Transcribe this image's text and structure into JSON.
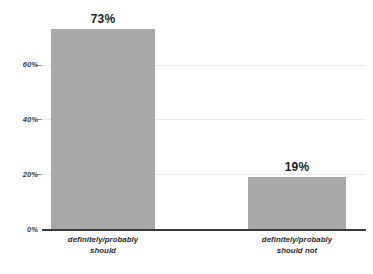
{
  "chart_data": {
    "type": "bar",
    "title": "",
    "subtitle": "",
    "xlabel": "",
    "ylabel": "",
    "categories": [
      "definitely/probably should",
      "definitely/probably should not"
    ],
    "category_lines": [
      [
        "definitely/probably",
        "should"
      ],
      [
        "definitely/probably",
        "should not"
      ]
    ],
    "values": [
      73,
      19
    ],
    "value_labels": [
      "73%",
      "19%"
    ],
    "ylim": [
      0,
      80
    ],
    "yticks": [
      0,
      20,
      40,
      60
    ],
    "ytick_labels": [
      "0%",
      "20%",
      "40%",
      "60%"
    ],
    "grid": true,
    "legend": false,
    "legend_position": "none",
    "bar_color": "#a8a8a8",
    "axis_color": "#3b3b3b",
    "gridline_color": "#ececed",
    "value_label_color": "#1c1c1c",
    "tick_label_color": "#3c3c3c"
  }
}
